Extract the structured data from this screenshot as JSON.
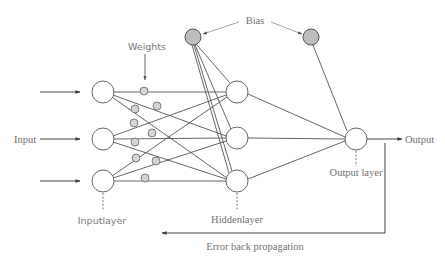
{
  "diagram": {
    "labels": {
      "input": "Input",
      "output": "Output",
      "weights": "Weights",
      "bias": "Bias",
      "input_layer": "Inputlayer",
      "hidden_layer": "Hiddenlayer",
      "output_layer": "Output layer",
      "error_back_propagation": "Error back propagation"
    },
    "layers": {
      "input": {
        "count": 3,
        "nodes": [
          [
            103,
            92
          ],
          [
            103,
            139
          ],
          [
            103,
            181
          ]
        ]
      },
      "hidden": {
        "count": 3,
        "nodes": [
          [
            237,
            92
          ],
          [
            237,
            138
          ],
          [
            237,
            181
          ]
        ]
      },
      "output": {
        "count": 1,
        "nodes": [
          [
            356,
            139
          ]
        ]
      }
    },
    "bias_nodes": [
      [
        193,
        37
      ],
      [
        311,
        37
      ]
    ],
    "weight_markers": [
      [
        144,
        91
      ],
      [
        157,
        106
      ],
      [
        135,
        109
      ],
      [
        134,
        123
      ],
      [
        152,
        133
      ],
      [
        135,
        142
      ],
      [
        136,
        158
      ],
      [
        156,
        161
      ],
      [
        145,
        178
      ]
    ],
    "colors": {
      "line": "#555555",
      "bias_fill": "#bdbdbd",
      "weight_fill": "#d4d4d4",
      "label": "#707070"
    }
  }
}
